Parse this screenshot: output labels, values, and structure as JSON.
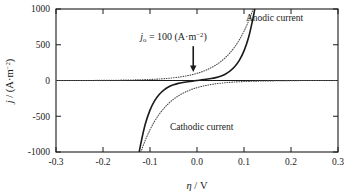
{
  "chart_data": {
    "type": "line",
    "title": "",
    "xlabel": "η / V",
    "ylabel": "j / (A·m⁻²)",
    "xlim": [
      -0.3,
      0.3
    ],
    "ylim": [
      -1000,
      1000
    ],
    "xticks": [
      -0.3,
      -0.2,
      -0.1,
      0.0,
      0.1,
      0.2,
      0.3
    ],
    "xtick_labels": [
      "-0.3",
      "-0.2",
      "-0.1",
      "0.0",
      "0.1",
      "0.2",
      "0.3"
    ],
    "yticks": [
      -1000,
      -500,
      0,
      500,
      1000
    ],
    "ytick_labels": [
      "-1000",
      "-500",
      "0",
      "500",
      "1000"
    ],
    "grid": false,
    "legend": "none",
    "parameters": {
      "exchange_current_density": 100,
      "exchange_current_density_units": "A·m⁻²",
      "transfer_coefficient": 0.5,
      "model": "Butler-Volmer",
      "thermal_voltage_RT_over_F": 0.02569
    },
    "series": [
      {
        "name": "total current (Butler-Volmer)",
        "style": "solid",
        "color": "#1a1a1a",
        "width": 1.6,
        "formula": "j = j0 * (exp(0.5*F*eta/RT) - exp(-0.5*F*eta/RT))",
        "x": [
          -0.125,
          -0.12,
          -0.11,
          -0.1,
          -0.09,
          -0.08,
          -0.07,
          -0.06,
          -0.05,
          -0.04,
          -0.03,
          -0.02,
          -0.01,
          0.0,
          0.01,
          0.02,
          0.03,
          0.04,
          0.05,
          0.06,
          0.07,
          0.08,
          0.09,
          0.1,
          0.11,
          0.12,
          0.125
        ],
        "y": [
          -1085,
          -897,
          -609,
          -414,
          -281,
          -191,
          -130,
          -88,
          -60,
          -40,
          -27,
          -18,
          -9,
          0,
          9,
          18,
          27,
          40,
          60,
          88,
          130,
          191,
          281,
          414,
          609,
          897,
          1085
        ]
      },
      {
        "name": "anodic partial current",
        "style": "dotted",
        "color": "#4a4a4a",
        "width": 1.1,
        "formula": "ja = j0 * exp(0.5*F*eta/RT)",
        "x": [
          -0.3,
          -0.26,
          -0.22,
          -0.18,
          -0.14,
          -0.12,
          -0.1,
          -0.08,
          -0.06,
          -0.04,
          -0.02,
          0.0,
          0.02,
          0.04,
          0.06,
          0.08,
          0.1,
          0.12,
          0.14,
          0.16,
          0.18
        ],
        "y": [
          0,
          1,
          1,
          3,
          7,
          10,
          14,
          21,
          31,
          46,
          68,
          100,
          147,
          216,
          318,
          468,
          689,
          1013,
          1490,
          2193,
          3226
        ]
      },
      {
        "name": "cathodic partial current",
        "style": "dotted",
        "color": "#4a4a4a",
        "width": 1.1,
        "formula": "jc = -j0 * exp(-0.5*F*eta/RT)",
        "x": [
          0.3,
          0.26,
          0.22,
          0.18,
          0.14,
          0.12,
          0.1,
          0.08,
          0.06,
          0.04,
          0.02,
          0.0,
          -0.02,
          -0.04,
          -0.06,
          -0.08,
          -0.1,
          -0.12,
          -0.14,
          -0.16,
          -0.18
        ],
        "y": [
          0,
          -1,
          -1,
          -3,
          -7,
          -10,
          -14,
          -21,
          -31,
          -46,
          -68,
          -100,
          -147,
          -216,
          -318,
          -468,
          -689,
          -1013,
          -1490,
          -2193,
          -3226
        ]
      }
    ],
    "annotations": [
      {
        "name": "exchange-current-annotation",
        "text": "j₀ = 100 (A·m⁻²)",
        "text_parts": {
          "symbol": "j",
          "subscript": "o",
          "equals": " = 100 (A·m",
          "superscript": "−2",
          "close": ")"
        },
        "x": -0.05,
        "y": 560,
        "arrow": {
          "name": "down-arrow",
          "from_x": -0.008,
          "from_y": 480,
          "to_x": -0.008,
          "to_y": 120
        }
      },
      {
        "name": "anodic-current-label",
        "text": "Anodic current",
        "x": 0.165,
        "y": 830
      },
      {
        "name": "cathodic-current-label",
        "text": "Cathodic current",
        "x": 0.01,
        "y": -690
      }
    ]
  },
  "figure": {
    "background_color": "#ffffff",
    "axis_color": "#1a1a1a",
    "curve_color": "#1a1a1a",
    "partial_curve_color": "#4a4a4a"
  }
}
